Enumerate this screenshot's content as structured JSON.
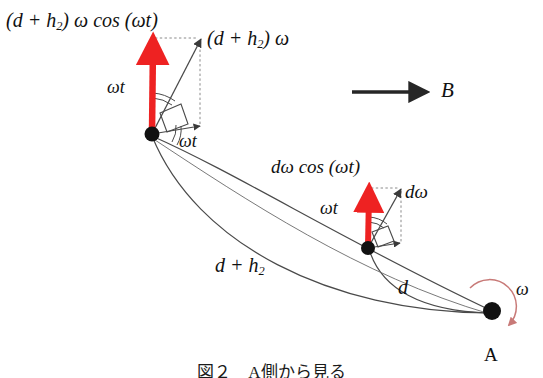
{
  "figure": {
    "caption": "図２　A側から見る",
    "background_color": "#ffffff",
    "stroke_color": "#3a3a3a",
    "vector_color": "#ee2222",
    "rotation_arc_color": "#c87a78",
    "width": 543,
    "height": 378
  },
  "labels": {
    "outer_vertical_component": "(d + h",
    "outer_vertical_component_sub": "2",
    "outer_vertical_component_tail": ") ω cos (ωt)",
    "outer_velocity": "(d + h",
    "outer_velocity_sub": "2",
    "outer_velocity_tail": ") ω",
    "angle_upper_left": "ωt",
    "angle_lower_left": "ωt",
    "field_direction": "B",
    "inner_vertical_component": "dω cos (ωt)",
    "inner_velocity": "dω",
    "angle_inner": "ωt",
    "radius_outer": "d + h",
    "radius_outer_sub": "2",
    "radius_inner": "d",
    "angular_velocity": "ω",
    "pivot_point": "A"
  },
  "points": {
    "pivot_A": {
      "x": 492,
      "y": 311,
      "label": "A"
    },
    "inner_mass": {
      "x": 368,
      "y": 248
    },
    "outer_mass": {
      "x": 152,
      "y": 134
    }
  },
  "vectors": {
    "outer_vertical": {
      "from_x": 152,
      "from_y": 134,
      "to_x": 153,
      "to_y": 40
    },
    "outer_total": {
      "from_x": 152,
      "from_y": 134,
      "to_x": 200,
      "to_y": 38
    },
    "outer_tangential": {
      "from_x": 152,
      "from_y": 134,
      "to_x": 200,
      "to_y": 125
    },
    "inner_vertical": {
      "from_x": 368,
      "from_y": 248,
      "to_x": 369,
      "to_y": 189
    },
    "inner_total": {
      "from_x": 368,
      "from_y": 248,
      "to_x": 400,
      "to_y": 190
    },
    "inner_tangential": {
      "from_x": 368,
      "from_y": 248,
      "to_x": 400,
      "to_y": 242
    },
    "field_B": {
      "from_x": 352,
      "from_y": 92,
      "to_x": 433,
      "to_y": 92
    }
  }
}
